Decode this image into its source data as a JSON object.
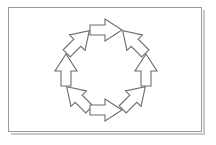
{
  "figure": {
    "title": "",
    "panel": {
      "background_color": "#ffffff",
      "border_color": "#9a9a9a",
      "shadow_color": "#c8c8c8"
    },
    "diagram": {
      "type": "cycle-diagram",
      "shape": "circular",
      "rotation_direction": "counter-clockwise",
      "arrow_count": 8,
      "arrow_outline_color": "#6d6d6d",
      "arrow_fill_color": "#ffffff",
      "center_x": 97,
      "center_y": 62,
      "radius": 40,
      "arrows": [
        {
          "id": "arrow-top",
          "label": "",
          "direction": "left",
          "angle_deg": 180,
          "position_deg": 270,
          "cx": 97,
          "cy": 22
        },
        {
          "id": "arrow-top-left",
          "label": "",
          "direction": "down-left",
          "angle_deg": 225,
          "position_deg": 225,
          "cx": 69,
          "cy": 34
        },
        {
          "id": "arrow-left",
          "label": "",
          "direction": "down",
          "angle_deg": 270,
          "position_deg": 180,
          "cx": 57,
          "cy": 62
        },
        {
          "id": "arrow-bottom-left",
          "label": "",
          "direction": "down-right",
          "angle_deg": 315,
          "position_deg": 135,
          "cx": 69,
          "cy": 90
        },
        {
          "id": "arrow-bottom",
          "label": "",
          "direction": "right",
          "angle_deg": 0,
          "position_deg": 90,
          "cx": 97,
          "cy": 102
        },
        {
          "id": "arrow-bottom-right",
          "label": "",
          "direction": "up-right",
          "angle_deg": 45,
          "position_deg": 45,
          "cx": 125,
          "cy": 90
        },
        {
          "id": "arrow-right",
          "label": "",
          "direction": "up",
          "angle_deg": 90,
          "position_deg": 0,
          "cx": 137,
          "cy": 62
        },
        {
          "id": "arrow-top-right",
          "label": "",
          "direction": "up-left",
          "angle_deg": 135,
          "position_deg": 315,
          "cx": 125,
          "cy": 34
        }
      ]
    }
  }
}
